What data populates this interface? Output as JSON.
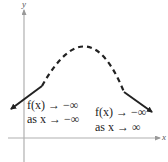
{
  "axes": {
    "x_label": "x",
    "y_label": "y",
    "axis_color": "#b0b0b0"
  },
  "curve": {
    "style": "dashed parabola opening downward",
    "color": "#222222",
    "left_end_behavior": "down-left arrow",
    "right_end_behavior": "down-right arrow"
  },
  "annotations": {
    "left": {
      "line1": "f(x) → −∞",
      "line2": "as x → −∞"
    },
    "right": {
      "line1": "f(x) → −∞",
      "line2": "as x → ∞"
    }
  }
}
